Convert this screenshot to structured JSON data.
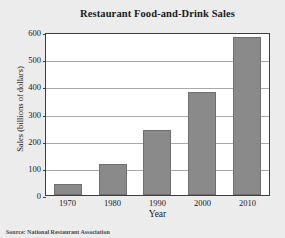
{
  "chart_data": {
    "type": "bar",
    "title": "Restaurant Food-and-Drink Sales",
    "xlabel": "Year",
    "ylabel": "Sales (billions of dollars)",
    "categories": [
      "1970",
      "1980",
      "1990",
      "2000",
      "2010"
    ],
    "values": [
      42,
      115,
      240,
      378,
      580
    ],
    "ylim": [
      0,
      600
    ],
    "yticks": [
      "600",
      "500",
      "400",
      "300",
      "200",
      "100",
      "0"
    ],
    "ytick_values": [
      600,
      500,
      400,
      300,
      200,
      100,
      0
    ],
    "grid": "horizontal",
    "legend": "none",
    "bar_color": "#8a8a8a",
    "plot_background": "#ffffff",
    "frame_color": "#3d3d3d",
    "gridline_color": "#a9a9a9"
  },
  "source_note": "Source: National Restaurant Association"
}
